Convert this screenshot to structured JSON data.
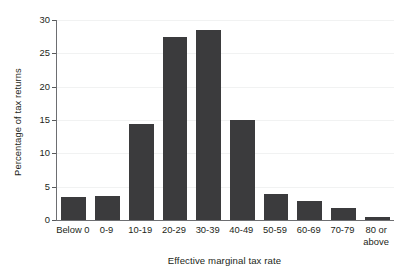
{
  "chart_data": {
    "type": "bar",
    "title": "",
    "subtitle": "",
    "xlabel": "Effective marginal tax rate",
    "ylabel": "Percentage of tax returns",
    "categories": [
      "Below 0",
      "0-9",
      "10-19",
      "20-29",
      "30-39",
      "40-49",
      "50-59",
      "60-69",
      "70-79",
      "80 or above"
    ],
    "values": [
      3.4,
      3.6,
      14.4,
      27.4,
      28.5,
      15.0,
      3.9,
      2.8,
      1.8,
      0.5
    ],
    "ylim": [
      0,
      30
    ],
    "yticks": [
      0,
      5,
      10,
      15,
      20,
      25,
      30
    ],
    "ytick_labels": [
      "0",
      "5",
      "10",
      "15",
      "20",
      "25",
      "30"
    ],
    "grid": true,
    "grid_axis": "y",
    "legend": false,
    "legend_position": "none",
    "bar_color": "#3b3b3d",
    "gridline_color": "#f1f2f2",
    "axis_color": "#6d6e71",
    "background_color": "#ffffff",
    "text_color": "#231f20"
  },
  "axis": {
    "x_title": "Effective marginal tax rate",
    "y_title": "Percentage of tax returns"
  },
  "x_labels": [
    {
      "line1": "Below 0",
      "line2": ""
    },
    {
      "line1": "0-9",
      "line2": ""
    },
    {
      "line1": "10-19",
      "line2": ""
    },
    {
      "line1": "20-29",
      "line2": ""
    },
    {
      "line1": "30-39",
      "line2": ""
    },
    {
      "line1": "40-49",
      "line2": ""
    },
    {
      "line1": "50-59",
      "line2": ""
    },
    {
      "line1": "60-69",
      "line2": ""
    },
    {
      "line1": "70-79",
      "line2": ""
    },
    {
      "line1": "80 or",
      "line2": "above"
    }
  ]
}
